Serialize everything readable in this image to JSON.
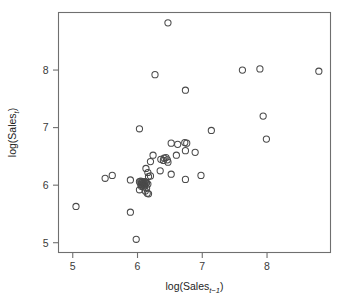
{
  "chart_data": {
    "type": "scatter",
    "title": "",
    "xlabel": "log(Sales_t-1)",
    "ylabel": "log(Sales_t)",
    "xlabel_parts": {
      "base": "log(Sales",
      "sub": "t−1",
      "close": ")"
    },
    "ylabel_parts": {
      "base": "log(Sales",
      "sub": "t",
      "close": ")"
    },
    "xlim": [
      4.78,
      8.98
    ],
    "ylim": [
      4.83,
      9.0
    ],
    "xticks": [
      5,
      6,
      7,
      8
    ],
    "yticks": [
      5,
      6,
      7,
      8
    ],
    "xtick_labels": [
      "5",
      "6",
      "7",
      "8"
    ],
    "ytick_labels": [
      "5",
      "6",
      "7",
      "8"
    ],
    "grid": false,
    "legend": "none",
    "marker": "open-circle",
    "marker_color": "#4a4a4a",
    "marker_radius_px": 3.1,
    "n_points": 61,
    "points": [
      [
        6.47,
        8.82
      ],
      [
        6.27,
        7.92
      ],
      [
        6.74,
        7.65
      ],
      [
        7.62,
        8.0
      ],
      [
        7.89,
        8.02
      ],
      [
        8.8,
        7.98
      ],
      [
        7.94,
        7.2
      ],
      [
        7.99,
        6.8
      ],
      [
        6.03,
        6.98
      ],
      [
        7.14,
        6.95
      ],
      [
        6.52,
        6.73
      ],
      [
        6.62,
        6.71
      ],
      [
        6.73,
        6.74
      ],
      [
        6.76,
        6.73
      ],
      [
        6.6,
        6.52
      ],
      [
        6.74,
        6.6
      ],
      [
        6.89,
        6.57
      ],
      [
        6.24,
        6.52
      ],
      [
        6.41,
        6.47
      ],
      [
        6.44,
        6.48
      ],
      [
        6.46,
        6.44
      ],
      [
        6.4,
        6.43
      ],
      [
        6.47,
        6.4
      ],
      [
        6.2,
        6.41
      ],
      [
        6.13,
        6.29
      ],
      [
        6.16,
        6.22
      ],
      [
        6.35,
        6.25
      ],
      [
        6.52,
        6.19
      ],
      [
        6.74,
        6.1
      ],
      [
        6.98,
        6.17
      ],
      [
        6.17,
        6.15
      ],
      [
        6.2,
        6.16
      ],
      [
        5.5,
        6.12
      ],
      [
        5.61,
        6.17
      ],
      [
        5.89,
        6.09
      ],
      [
        6.03,
        6.06
      ],
      [
        6.05,
        6.07
      ],
      [
        6.06,
        6.05
      ],
      [
        6.07,
        6.04
      ],
      [
        6.08,
        6.06
      ],
      [
        6.09,
        6.03
      ],
      [
        6.1,
        6.05
      ],
      [
        6.11,
        6.02
      ],
      [
        6.12,
        6.06
      ],
      [
        6.13,
        6.03
      ],
      [
        6.05,
        6.01
      ],
      [
        6.08,
        6.0
      ],
      [
        6.11,
        5.99
      ],
      [
        6.14,
        6.04
      ],
      [
        6.16,
        6.02
      ],
      [
        6.03,
        5.92
      ],
      [
        6.12,
        5.9
      ],
      [
        6.15,
        5.86
      ],
      [
        6.17,
        5.85
      ],
      [
        6.09,
        5.97
      ],
      [
        6.06,
        5.98
      ],
      [
        6.14,
        5.95
      ],
      [
        5.89,
        5.53
      ],
      [
        5.05,
        5.63
      ],
      [
        5.98,
        5.06
      ],
      [
        6.36,
        6.45
      ]
    ]
  },
  "figure": {
    "background": "#ffffff",
    "axis_color": "#6f6f6f",
    "text_color": "#3a3a3a"
  }
}
